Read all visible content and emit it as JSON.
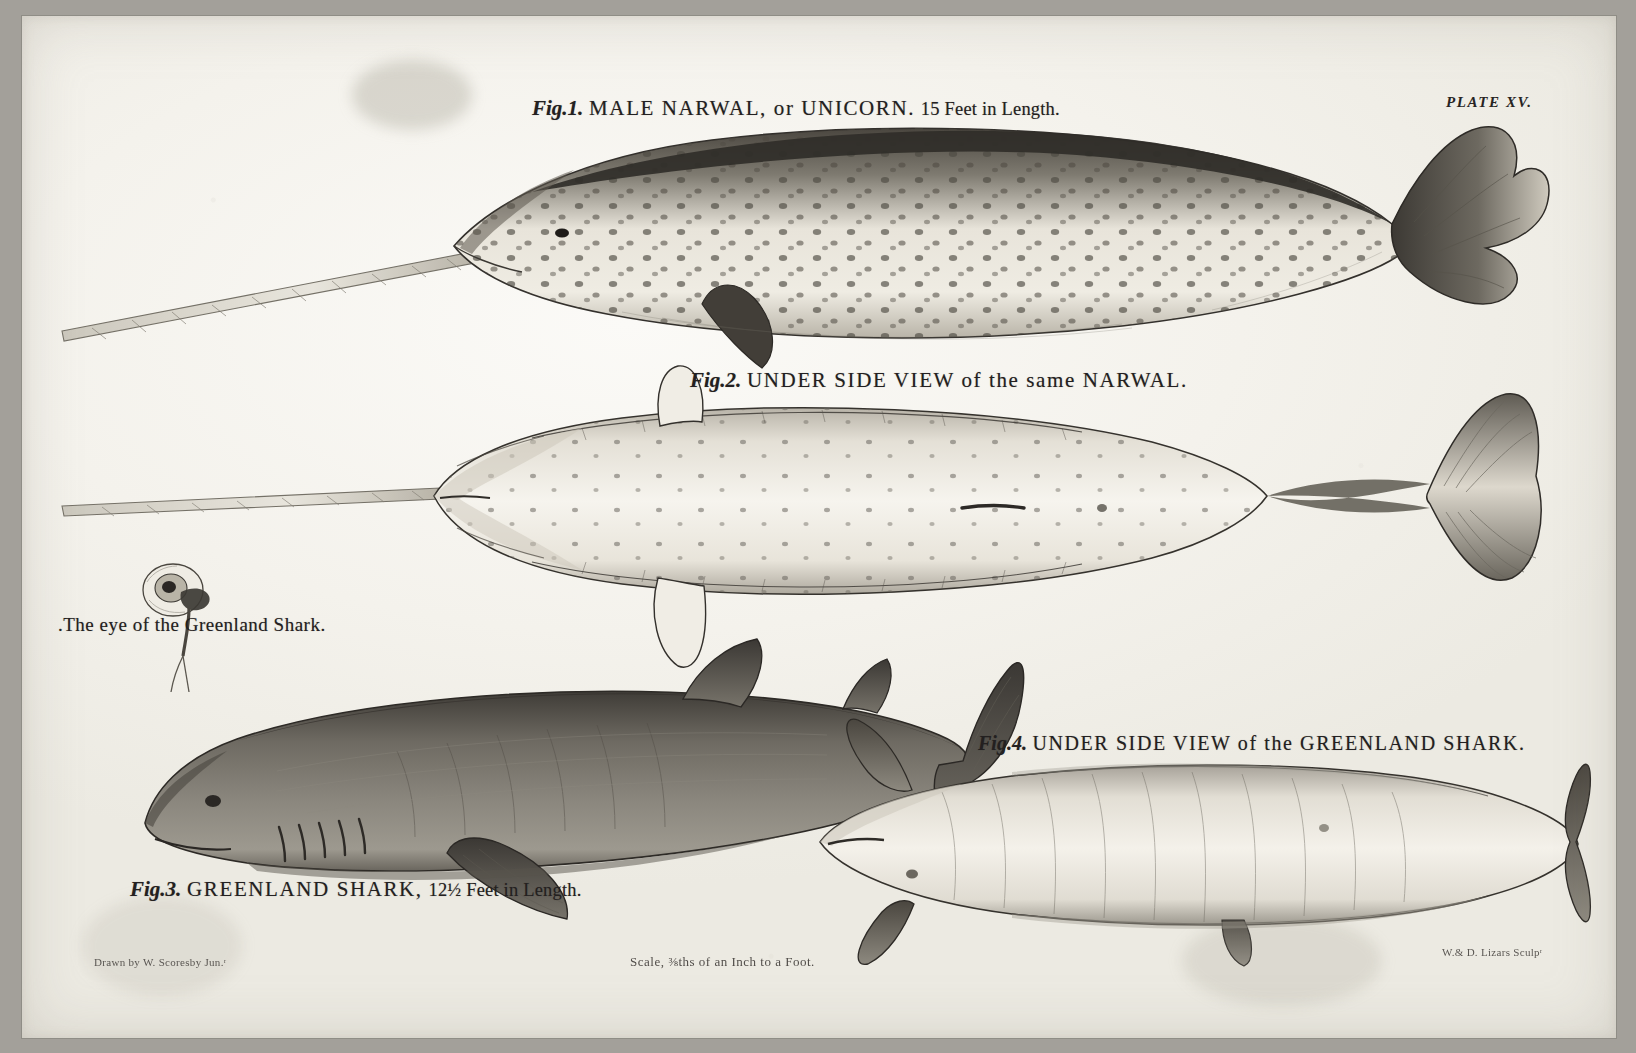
{
  "plate": {
    "number_label": "PLATE XV.",
    "ink_color": "#232020",
    "paper_color": "#f4f2ec",
    "border_color": "#8e8c86"
  },
  "figures": [
    {
      "id": "fig1",
      "fig_label": "Fig.1.",
      "title": "MALE NARWAL, or UNICORN.",
      "measurement": "15 Feet in Length.",
      "subject": "male narwhal lateral view with tusk",
      "body_color": "#efece4",
      "dorsal_color": "#3b3834"
    },
    {
      "id": "fig2",
      "fig_label": "Fig.2.",
      "title": "UNDER SIDE VIEW of the same NARWAL.",
      "measurement": "",
      "subject": "narwhal ventral view with tusk and flukes",
      "body_color": "#f2efe8",
      "dorsal_color": "#4a4641"
    },
    {
      "id": "fig3",
      "fig_label": "Fig.3.",
      "title": "GREENLAND SHARK,",
      "measurement": "12½ Feet in Length.",
      "subject": "greenland shark lateral view",
      "body_color": "#7d7a72",
      "dorsal_color": "#3a3733"
    },
    {
      "id": "fig4",
      "fig_label": "Fig.4.",
      "title": "UNDER SIDE VIEW of the GREENLAND SHARK.",
      "measurement": "",
      "subject": "greenland shark ventral view",
      "body_color": "#eeebe3",
      "dorsal_color": "#55514b"
    }
  ],
  "detail": {
    "eye_label": ".The eye of   the Greenland Shark.",
    "subject": "detached eye of greenland shark with parasite"
  },
  "credits": {
    "drawn_by": "Drawn by W. Scoresby Jun.ʳ",
    "scale_note": "Scale, ⅜ths of an Inch to a Foot.",
    "engraved_by": "W.& D. Lizars Sculpʳ"
  }
}
